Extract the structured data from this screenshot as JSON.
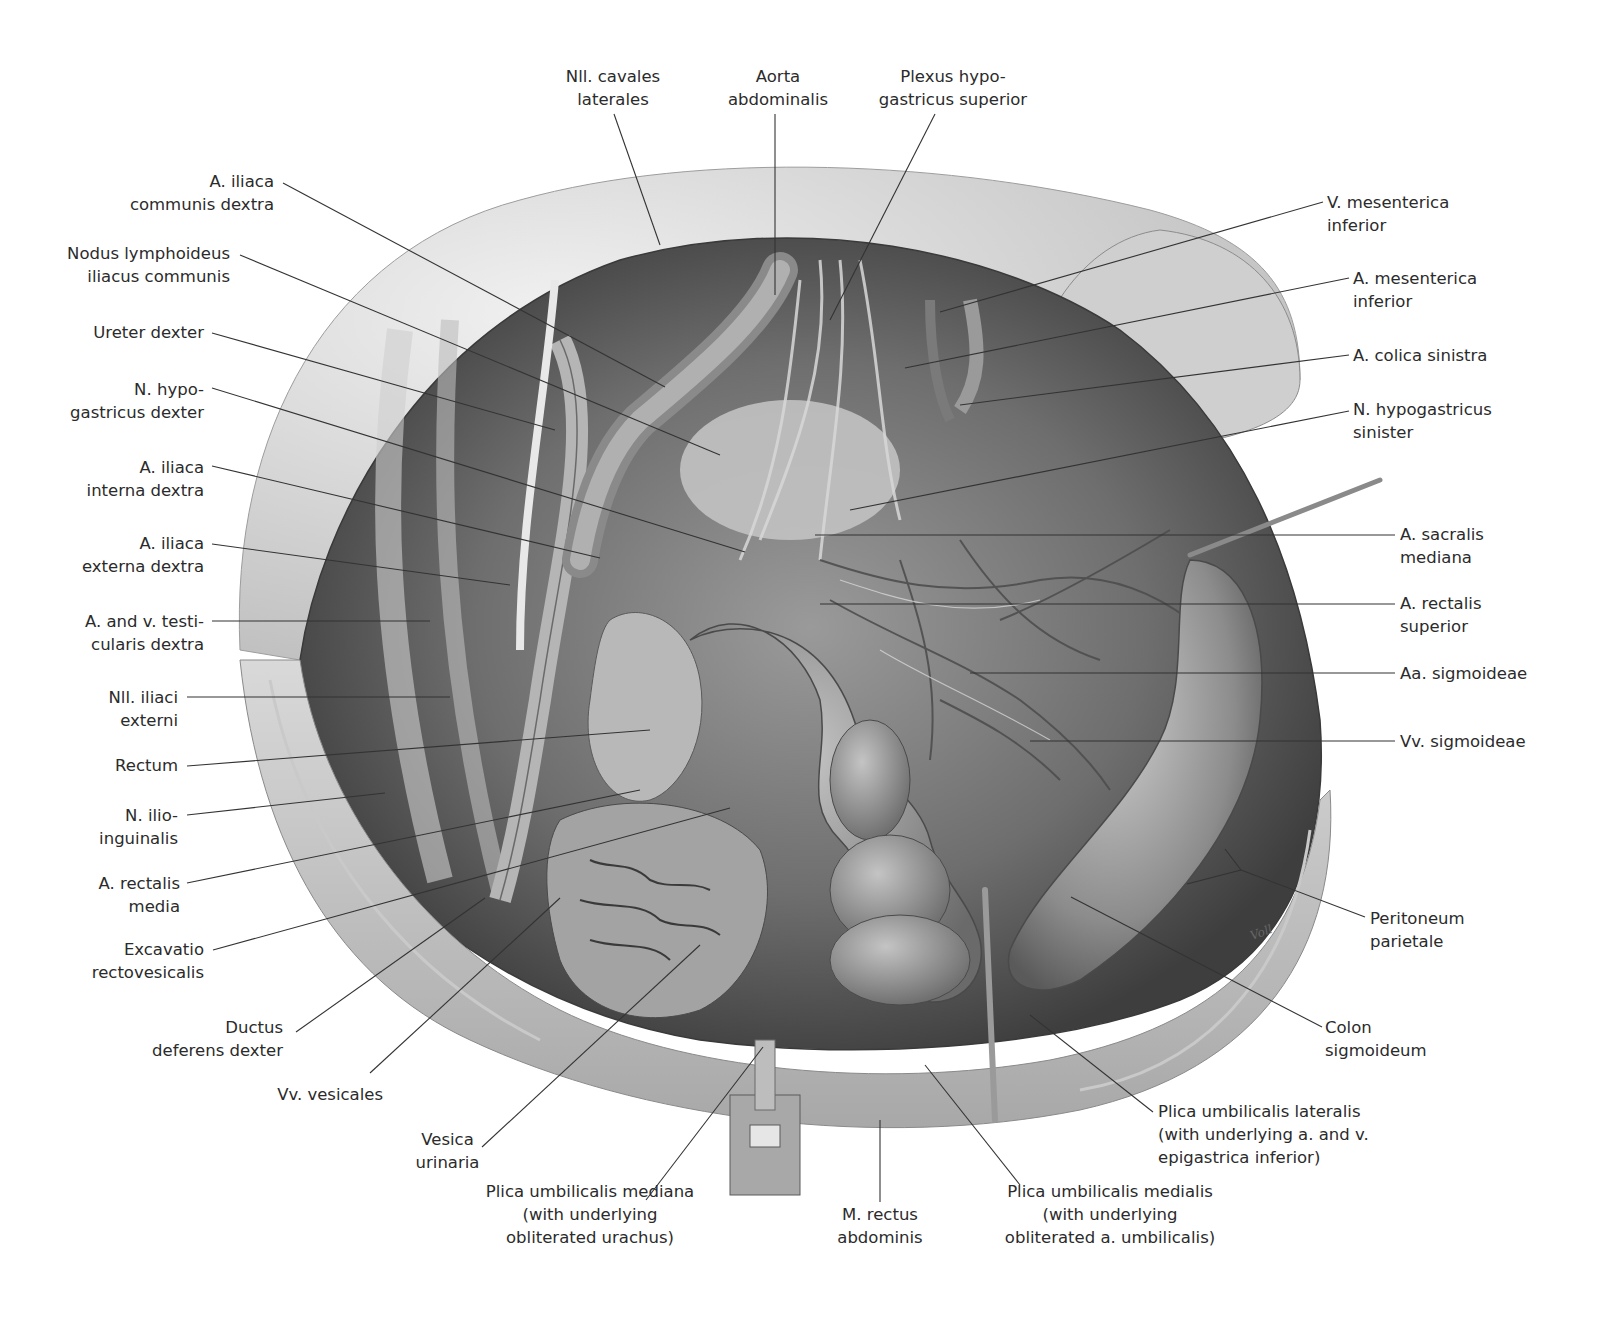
{
  "figure": {
    "type": "anatomical-illustration",
    "signature": "Voll",
    "tones": {
      "background": "#ffffff",
      "tissue_light": "#e6e6e6",
      "tissue_mid": "#a9a9a9",
      "tissue_dark": "#4a4a4a",
      "leader_line": "#333333",
      "label_text": "#2b2b2b"
    }
  },
  "labels": {
    "top": [
      {
        "id": "nll-cavales-laterales",
        "text": "Nll. cavales\nlaterales"
      },
      {
        "id": "aorta-abdominalis",
        "text": "Aorta\nabdominalis"
      },
      {
        "id": "plexus-hypogastricus-superior",
        "text": "Plexus hypo-\ngastricus superior"
      }
    ],
    "left": [
      {
        "id": "a-iliaca-communis-dextra",
        "text": "A. iliaca\ncommunis dextra"
      },
      {
        "id": "nodus-lymphoideus-iliacus-communis",
        "text": "Nodus lymphoideus\niliacus communis"
      },
      {
        "id": "ureter-dexter",
        "text": "Ureter dexter"
      },
      {
        "id": "n-hypogastricus-dexter",
        "text": "N. hypo-\ngastricus dexter"
      },
      {
        "id": "a-iliaca-interna-dextra",
        "text": "A. iliaca\ninterna dextra"
      },
      {
        "id": "a-iliaca-externa-dextra",
        "text": "A. iliaca\nexterna dextra"
      },
      {
        "id": "a-v-testicularis-dextra",
        "text": "A. and v. testi-\ncularis dextra"
      },
      {
        "id": "nll-iliaci-externi",
        "text": "Nll. iliaci\nexterni"
      },
      {
        "id": "rectum",
        "text": "Rectum"
      },
      {
        "id": "n-ilioinguinalis",
        "text": "N. ilio-\ninguinalis"
      },
      {
        "id": "a-rectalis-media",
        "text": "A. rectalis\nmedia"
      },
      {
        "id": "excavatio-rectovesicalis",
        "text": "Excavatio\nrectovesicalis"
      },
      {
        "id": "ductus-deferens-dexter",
        "text": "Ductus\ndeferens dexter"
      },
      {
        "id": "vv-vesicales",
        "text": "Vv. vesicales"
      },
      {
        "id": "vesica-urinaria",
        "text": "Vesica\nurinaria"
      }
    ],
    "bottom": [
      {
        "id": "plica-umbilicalis-mediana",
        "text": "Plica umbilicalis mediana\n(with underlying\nobliterated urachus)"
      },
      {
        "id": "m-rectus-abdominis",
        "text": "M. rectus\nabdominis"
      },
      {
        "id": "plica-umbilicalis-medialis",
        "text": "Plica umbilicalis medialis\n(with underlying\nobliterated a. umbilicalis)"
      }
    ],
    "right": [
      {
        "id": "v-mesenterica-inferior",
        "text": "V. mesenterica\ninferior"
      },
      {
        "id": "a-mesenterica-inferior",
        "text": "A. mesenterica\ninferior"
      },
      {
        "id": "a-colica-sinistra",
        "text": "A. colica sinistra"
      },
      {
        "id": "n-hypogastricus-sinister",
        "text": "N. hypogastricus\nsinister"
      },
      {
        "id": "a-sacralis-mediana",
        "text": "A. sacralis\nmediana"
      },
      {
        "id": "a-rectalis-superior",
        "text": "A. rectalis\nsuperior"
      },
      {
        "id": "aa-sigmoideae",
        "text": "Aa. sigmoideae"
      },
      {
        "id": "vv-sigmoideae",
        "text": "Vv. sigmoideae"
      },
      {
        "id": "peritoneum-parietale",
        "text": "Peritoneum\nparietale"
      },
      {
        "id": "colon-sigmoideum",
        "text": "Colon\nsigmoideum"
      },
      {
        "id": "plica-umbilicalis-lateralis",
        "text": "Plica umbilicalis lateralis\n(with underlying a. and v.\nepigastrica inferior)"
      }
    ]
  }
}
